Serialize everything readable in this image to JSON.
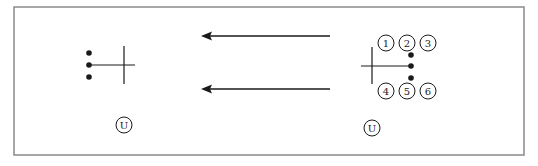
{
  "diagram": {
    "frame": {
      "x": 14,
      "y": 7,
      "w": 510,
      "h": 148,
      "stroke": "#8a8a8a"
    },
    "ink_color": "#1a1a1a",
    "left_figure": {
      "dots": [
        [
          89,
          53
        ],
        [
          89,
          65
        ],
        [
          89,
          77
        ]
      ],
      "hline": {
        "x1": 89,
        "x2": 135,
        "y": 65
      },
      "vline": {
        "x": 124,
        "y1": 46,
        "y2": 84
      },
      "u_circle": {
        "cx": 124,
        "cy": 125,
        "r": 8,
        "label": "U"
      }
    },
    "arrows": [
      {
        "x1": 330,
        "x2": 201,
        "y": 36,
        "direction": "left"
      },
      {
        "x1": 330,
        "x2": 201,
        "y": 89,
        "direction": "left"
      }
    ],
    "right_figure": {
      "dots": [
        [
          411,
          55
        ],
        [
          411,
          66
        ],
        [
          411,
          78
        ]
      ],
      "hline": {
        "x1": 361,
        "x2": 411,
        "y": 66
      },
      "vline": {
        "x": 372,
        "y1": 47,
        "y2": 84
      },
      "numbered_circles": [
        {
          "cx": 386,
          "cy": 43,
          "r": 8,
          "label": "1"
        },
        {
          "cx": 407,
          "cy": 43,
          "r": 8,
          "label": "2"
        },
        {
          "cx": 428,
          "cy": 43,
          "r": 8,
          "label": "3"
        },
        {
          "cx": 386,
          "cy": 91,
          "r": 8,
          "label": "4"
        },
        {
          "cx": 407,
          "cy": 91,
          "r": 8,
          "label": "5"
        },
        {
          "cx": 428,
          "cy": 91,
          "r": 8,
          "label": "6"
        }
      ],
      "u_circle": {
        "cx": 372,
        "cy": 128,
        "r": 8,
        "label": "U"
      }
    }
  }
}
